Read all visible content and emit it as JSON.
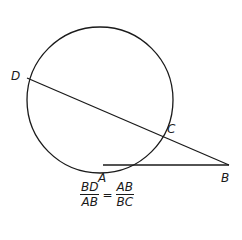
{
  "diagram": {
    "circle": {
      "cx": 100,
      "cy": 100,
      "r": 73
    },
    "points": {
      "A": {
        "x": 103,
        "y": 165,
        "label": "A"
      },
      "B": {
        "x": 229,
        "y": 165,
        "label": "B"
      },
      "C": {
        "x": 160,
        "y": 134,
        "label": "C"
      },
      "D": {
        "x": 27,
        "y": 78,
        "label": "D"
      }
    },
    "segments": [
      "DB",
      "AB"
    ],
    "stroke_color": "#1a1a1a"
  },
  "formula": {
    "left_num": "BD",
    "left_den": "AB",
    "equals": "=",
    "right_num": "AB",
    "right_den": "BC"
  }
}
